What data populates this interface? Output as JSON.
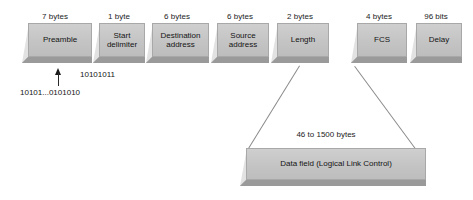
{
  "diagram": {
    "colors": {
      "block_front": "#c8c8c8",
      "block_side": "#e2e2e2",
      "block_bottom": "#9a9a9a",
      "connector": "#8a8a8a",
      "text": "#141414",
      "background": "#ffffff"
    },
    "frame_fields": [
      {
        "size": "7 bytes",
        "name": "Preamble"
      },
      {
        "size": "1 byte",
        "name": "Start\ndelimiter"
      },
      {
        "size": "6 bytes",
        "name": "Destination\naddress"
      },
      {
        "size": "6 bytes",
        "name": "Source\naddress"
      },
      {
        "size": "2 bytes",
        "name": "Length"
      },
      {
        "size": "4 bytes",
        "name": "FCS"
      },
      {
        "size": "96 bits",
        "name": "Delay"
      }
    ],
    "data_field": {
      "size": "46 to 1500 bytes",
      "name": "Data field (Logical Link Control)"
    },
    "annotations": {
      "start_delimiter_bits": "10101011",
      "preamble_bits": "10101...0101010"
    }
  }
}
